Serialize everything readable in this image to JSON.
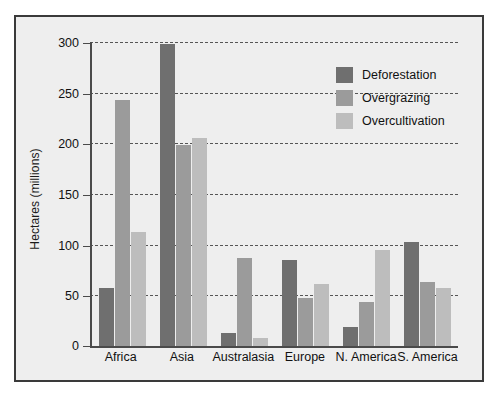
{
  "chart_data": {
    "type": "bar",
    "title": "",
    "subtitle": "",
    "xlabel": "",
    "ylabel": "Hectares (millions)",
    "categories": [
      "Africa",
      "Asia",
      "Australasia",
      "Europe",
      "N. America",
      "S. America"
    ],
    "series": [
      {
        "name": "Deforestation",
        "color": "#6f6f6f",
        "values": [
          57,
          298,
          13,
          85,
          19,
          103
        ]
      },
      {
        "name": "Overgrazing",
        "color": "#9b9b9b",
        "values": [
          243,
          198,
          87,
          47,
          43,
          63
        ]
      },
      {
        "name": "Overcultivation",
        "color": "#bdbdbd",
        "values": [
          113,
          205,
          8,
          61,
          95,
          57
        ]
      }
    ],
    "ylim": [
      0,
      300
    ],
    "yticks": [
      0,
      50,
      100,
      150,
      200,
      250,
      300
    ],
    "ytick_labels": [
      "0",
      "50",
      "100",
      "150",
      "200",
      "250",
      "300"
    ],
    "grid": true,
    "grid_style": "dashed",
    "grid_axis": "y",
    "legend_position": "upper-right-inside",
    "plot_background": "#eeeeee",
    "frame_color": "#3a3a3a"
  }
}
